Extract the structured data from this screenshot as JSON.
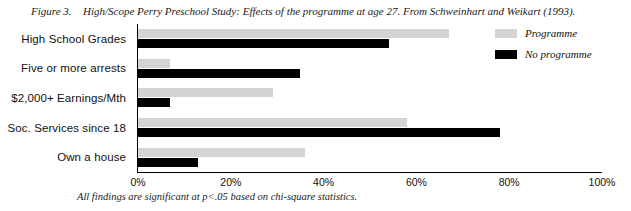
{
  "caption": {
    "figure_label": "Figure 3.",
    "text": "High/Scope Perry Preschool Study: Effects of the programme at age 27. From Schweinhart and Weikart (1993)."
  },
  "footnote": "All findings are significant at p<.05 based on chi-square statistics.",
  "legend": {
    "position": "top-right",
    "entries": [
      {
        "label": "Programme",
        "color": "#d4d4d4"
      },
      {
        "label": "No programme",
        "color": "#000000"
      }
    ]
  },
  "axis": {
    "tick_labels": [
      "0%",
      "20%",
      "40%",
      "60%",
      "80%",
      "100%"
    ]
  },
  "chart_data": {
    "type": "bar",
    "orientation": "horizontal",
    "title": "High/Scope Perry Preschool Study: Effects of the programme at age 27. From Schweinhart and Weikart (1993).",
    "xlabel": "",
    "ylabel": "",
    "xlim": [
      0,
      100
    ],
    "xticks": [
      0,
      20,
      40,
      60,
      80,
      100
    ],
    "xtick_labels": [
      "0%",
      "20%",
      "40%",
      "60%",
      "80%",
      "100%"
    ],
    "grid": false,
    "legend_position": "top-right",
    "categories": [
      "High School Grades",
      "Five or more arrests",
      "$2,000+ Earnings/Mth",
      "Soc. Services since 18",
      "Own a house"
    ],
    "series": [
      {
        "name": "Programme",
        "color": "#d4d4d4",
        "values": [
          67,
          7,
          29,
          58,
          36
        ]
      },
      {
        "name": "No programme",
        "color": "#000000",
        "values": [
          54,
          35,
          7,
          78,
          13
        ]
      }
    ],
    "annotation": "All findings are significant at p<.05 based on chi-square statistics."
  }
}
